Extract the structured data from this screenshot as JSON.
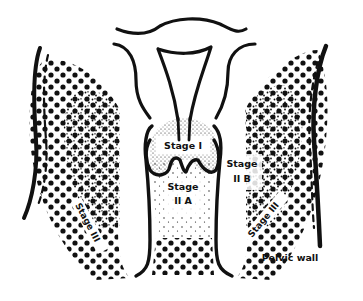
{
  "diagram": {
    "labels": {
      "stage_1": "Stage I",
      "stage_2a_line1": "Stage",
      "stage_2a_line2": "II A",
      "stage_2b_line1": "Stage",
      "stage_2b_line2": "II B",
      "stage_3_left": "Stage III",
      "stage_3_right": "Stage III",
      "pelvic_wall": "Pelvic wall"
    },
    "colors": {
      "ink": "#111111",
      "background": "#ffffff"
    }
  }
}
